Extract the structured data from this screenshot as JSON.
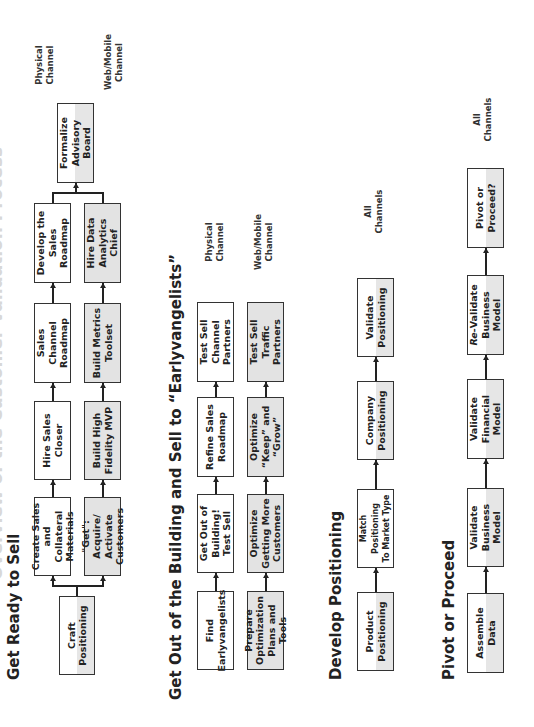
{
  "page_title": "Overview of the Customer Validation Process",
  "sections": [
    {
      "title": "Get Ready to Sell",
      "boxes": {
        "craft": "Craft\nPositioning",
        "create_sales": "Create Sales\nand Collateral\nMaterials",
        "get_acquire": "\"Get\": Acquire/\nActivate\nCustomers",
        "hire_closer": "Hire Sales\nCloser",
        "build_mvp": "Build High\nFidelity MVP",
        "sales_channel": "Sales Channel\nRoadmap",
        "metrics": "Build Metrics\nToolset",
        "develop_roadmap": "Develop the\nSales\nRoadmap",
        "data_chief": "Hire Data\nAnalytics Chief",
        "advisory": "Formalize\nAdvisory Board"
      },
      "channels": {
        "physical": "Physical\nChannel",
        "web": "Web/Mobile\nChannel"
      }
    },
    {
      "title": "Get Out of the Building and Sell to “Earlyvangelists”",
      "boxes": {
        "find": "Find\nEarlyvangelists",
        "prepare": "Prepare\nOptimization\nPlans and Tools",
        "get_out": "Get Out of\nBuilding!\nTest Sell",
        "optimize_more": "Optimize\nGetting More\nCustomers",
        "refine": "Refine Sales\nRoadmap",
        "keep_grow": "Optimize\n“Keep” and\n“Grow”",
        "channel_partners": "Test Sell\nChannel\nPartners",
        "traffic_partners": "Test Sell\nTraffic\nPartners"
      },
      "channels": {
        "physical": "Physical\nChannel",
        "web": "Web/Mobile\nChannel"
      }
    },
    {
      "title": "Develop Positioning",
      "boxes": {
        "product": "Product\nPositioning",
        "match": "Match Positioning\nTo Market Type",
        "company": "Company\nPositioning",
        "validate": "Validate\nPositioning"
      },
      "channels": {
        "all": "All\nChannels"
      }
    },
    {
      "title": "Pivot or Proceed",
      "boxes": {
        "assemble": "Assemble\nData",
        "validate_bm": "Validate\nBusiness Model",
        "validate_fm": "Validate\nFinancial Model",
        "revalidate_prefix": "Re-",
        "revalidate_rest": "Validate\nBusiness Model",
        "pivot": "Pivot or\nProceed?"
      },
      "channels": {
        "all": "All\nChannels"
      }
    }
  ]
}
